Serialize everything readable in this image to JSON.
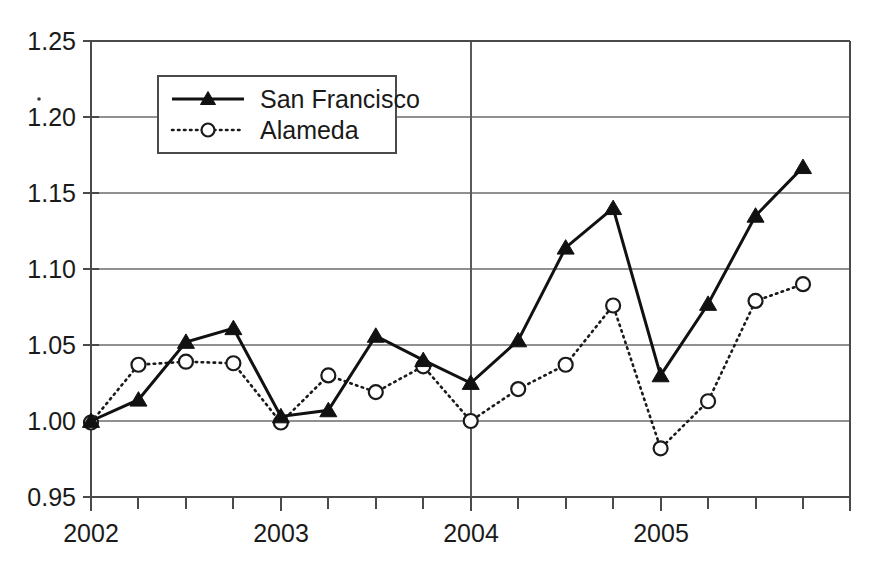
{
  "chart_data": {
    "type": "line",
    "title": "",
    "xlabel": "",
    "ylabel": "",
    "ylim": [
      0.95,
      1.25
    ],
    "ytick_labels": [
      "0.95",
      "1.00",
      "1.05",
      "1.10",
      "1.15",
      "1.20",
      "1.25"
    ],
    "ytick_values": [
      0.95,
      1.0,
      1.05,
      1.1,
      1.15,
      1.2,
      1.25
    ],
    "xtick_labels": [
      "2002",
      "2003",
      "2004",
      "2005"
    ],
    "xtick_values": [
      2002,
      2003,
      2004,
      2005
    ],
    "x": [
      2002.0,
      2002.25,
      2002.5,
      2002.75,
      2003.0,
      2003.25,
      2003.5,
      2003.75,
      2004.0,
      2004.25,
      2004.5,
      2004.75,
      2005.0,
      2005.25,
      2005.5,
      2005.75
    ],
    "grid": "horizontal-plus-vertical-at-2004",
    "legend_position": "upper-left-inside",
    "series": [
      {
        "name": "San Francisco",
        "marker": "filled-triangle",
        "linestyle": "solid",
        "values": [
          1.0,
          1.014,
          1.052,
          1.061,
          1.003,
          1.007,
          1.056,
          1.04,
          1.025,
          1.053,
          1.114,
          1.14,
          1.03,
          1.077,
          1.135,
          1.167
        ]
      },
      {
        "name": "Alameda",
        "marker": "open-circle",
        "linestyle": "dotted",
        "values": [
          0.999,
          1.037,
          1.039,
          1.038,
          0.999,
          1.03,
          1.019,
          1.036,
          1.0,
          1.021,
          1.037,
          1.076,
          0.982,
          1.013,
          1.079,
          1.09
        ]
      }
    ],
    "annotations": [],
    "colors": {
      "series_san_francisco": "#111111",
      "series_alameda": "#1a1a1a",
      "grid": "#6b6b6b",
      "frame": "#4a4a4a",
      "background": "#ffffff",
      "text": "#1a1a1a"
    }
  },
  "legend": {
    "entries": [
      {
        "label": "San Francisco"
      },
      {
        "label": "Alameda"
      }
    ]
  },
  "axes": {
    "y_labels": [
      "1.25",
      "1.20",
      "1.15",
      "1.10",
      "1.05",
      "1.00",
      "0.95"
    ],
    "x_labels": [
      "2002",
      "2003",
      "2004",
      "2005"
    ]
  }
}
